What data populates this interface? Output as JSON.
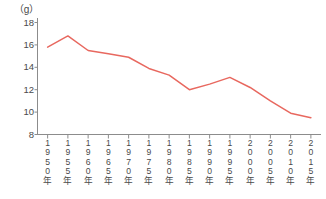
{
  "chart_data": {
    "type": "line",
    "title": "",
    "subtitle": "",
    "xlabel": "",
    "ylabel": "",
    "unit_label": "（g）",
    "ylim": [
      8,
      18
    ],
    "y_ticks": [
      8,
      10,
      12,
      14,
      16,
      18
    ],
    "y_tick_labels": [
      "8",
      "10",
      "12",
      "14",
      "16",
      "18"
    ],
    "grid": false,
    "legend": null,
    "legend_position": "none",
    "line_color": "#e8685f",
    "axis_color": "#8c8c8c",
    "categories": [
      "1950年",
      "1955年",
      "1960年",
      "1965年",
      "1970年",
      "1975年",
      "1980年",
      "1985年",
      "1990年",
      "1995年",
      "2000年",
      "2005年",
      "2010年",
      "2015年"
    ],
    "x": [
      1950,
      1955,
      1960,
      1965,
      1970,
      1975,
      1980,
      1985,
      1990,
      1995,
      2000,
      2005,
      2010,
      2015
    ],
    "values": [
      15.8,
      16.8,
      15.5,
      15.2,
      14.9,
      13.9,
      13.3,
      12.0,
      12.5,
      13.1,
      12.2,
      11.0,
      9.9,
      9.5
    ],
    "series": [
      {
        "name": "",
        "color": "#e8685f",
        "values": [
          15.8,
          16.8,
          15.5,
          15.2,
          14.9,
          13.9,
          13.3,
          12.0,
          12.5,
          13.1,
          12.2,
          11.0,
          9.9,
          9.5
        ]
      }
    ],
    "annotations": []
  }
}
